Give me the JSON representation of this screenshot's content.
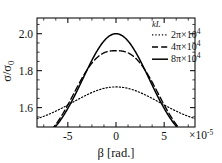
{
  "chart_data": {
    "type": "line",
    "title": "",
    "xlabel": "β [rad.]",
    "ylabel": "σ/σ₀",
    "x_multiplier": "×10",
    "x_multiplier_exp": "-5",
    "xlim": [
      -8.2e-05,
      8.2e-05
    ],
    "ylim": [
      1.495,
      2.085
    ],
    "xticks": [
      -5e-05,
      0,
      5e-05
    ],
    "xticklabels": [
      "-5",
      "0",
      "5"
    ],
    "yticks": [
      1.6,
      1.8,
      2.0
    ],
    "yticklabels": [
      "1.6",
      "1.8",
      "2.0"
    ],
    "minor_xticks": [
      -7.5e-05,
      -6.25e-05,
      -3.75e-05,
      -2.5e-05,
      -1.25e-05,
      1.25e-05,
      2.5e-05,
      3.75e-05,
      6.25e-05,
      7.5e-05
    ],
    "minor_yticks": [
      1.55,
      1.65,
      1.7,
      1.75,
      1.85,
      1.9,
      1.95,
      2.05
    ],
    "grid": false,
    "legend_position": "top-right",
    "legend_title": "kL",
    "series": [
      {
        "name": "2π×10⁴",
        "label_base": "2π×10",
        "label_exp": "4",
        "style": "dotted",
        "color": "#000000",
        "peak_value": 1.712,
        "baseline": 1.5,
        "width_param": 5.3e-05,
        "shape_power": 2.0,
        "x": [
          -8e-05,
          -7e-05,
          -6e-05,
          -5e-05,
          -4e-05,
          -3e-05,
          -2e-05,
          -1e-05,
          0.0,
          1e-05,
          2e-05,
          3e-05,
          4e-05,
          5e-05,
          6e-05,
          7e-05,
          8e-05
        ],
        "y": [
          1.424,
          1.495,
          1.556,
          1.606,
          1.646,
          1.676,
          1.697,
          1.709,
          1.712,
          1.709,
          1.697,
          1.676,
          1.646,
          1.606,
          1.556,
          1.495,
          1.424
        ]
      },
      {
        "name": "4π×10⁴",
        "label_base": "4π×10",
        "label_exp": "4",
        "style": "dashed",
        "color": "#000000",
        "peak_value": 1.908,
        "baseline": 1.4,
        "width_param": 4.6e-05,
        "shape_power": 2.6,
        "x": [
          -8e-05,
          -7e-05,
          -6e-05,
          -5e-05,
          -4e-05,
          -3e-05,
          -2e-05,
          -1e-05,
          0.0,
          1e-05,
          2e-05,
          3e-05,
          4e-05,
          5e-05,
          6e-05,
          7e-05,
          8e-05
        ],
        "y": [
          1.301,
          1.47,
          1.617,
          1.73,
          1.81,
          1.862,
          1.891,
          1.905,
          1.908,
          1.905,
          1.891,
          1.862,
          1.81,
          1.73,
          1.617,
          1.47,
          1.301
        ]
      },
      {
        "name": "8π×10⁴",
        "label_base": "8π×10",
        "label_exp": "4",
        "style": "solid",
        "color": "#000000",
        "peak_value": 2.0,
        "baseline": 1.38,
        "width_param": 4.05e-05,
        "shape_power": 2.0,
        "x": [
          -8e-05,
          -7e-05,
          -6e-05,
          -5e-05,
          -4e-05,
          -3e-05,
          -2e-05,
          -1e-05,
          0.0,
          1e-05,
          2e-05,
          3e-05,
          4e-05,
          5e-05,
          6e-05,
          7e-05,
          8e-05
        ],
        "y": [
          1.216,
          1.4,
          1.57,
          1.71,
          1.818,
          1.898,
          1.952,
          1.988,
          2.0,
          1.988,
          1.952,
          1.898,
          1.818,
          1.71,
          1.57,
          1.4,
          1.216
        ]
      }
    ]
  }
}
